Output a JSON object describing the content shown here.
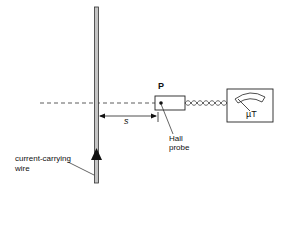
{
  "diagram": {
    "point_label": "P",
    "distance_label": "s",
    "meter_unit": "µT",
    "probe_label_line1": "Hall",
    "probe_label_line2": "probe",
    "wire_label_line1": "current-carrying",
    "wire_label_line2": "wire"
  },
  "colors": {
    "line": "#222222",
    "wire_fill": "#bfbfbf",
    "background": "#ffffff"
  }
}
